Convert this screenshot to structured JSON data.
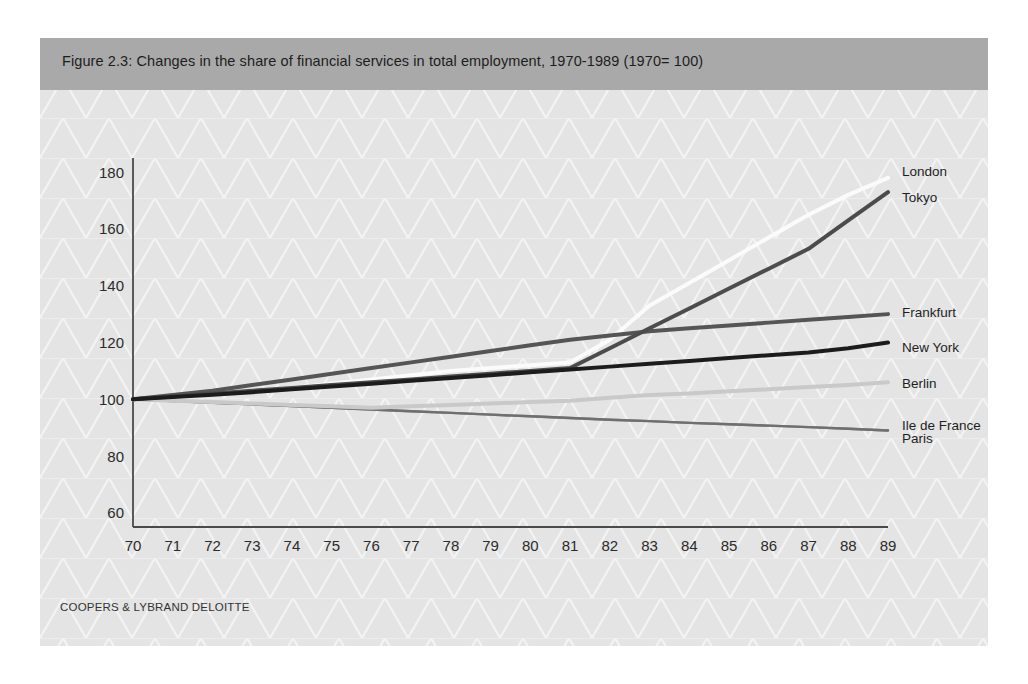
{
  "figure": {
    "caption": "Figure 2.3: Changes in the share of financial services in total employment, 1970-1989  (1970= 100)",
    "source_note": "COOPERS & LYBRAND DELOITTE",
    "background_color": "#e4e4e4",
    "caption_band_color": "#a9a9a9",
    "lattice_color": "#f4f4f4"
  },
  "chart_data": {
    "type": "line",
    "title": "Figure 2.3: Changes in the share of financial services in total employment, 1970-1989  (1970= 100)",
    "xlabel": "",
    "ylabel": "",
    "grid": false,
    "legend_position": "right-inline",
    "xlim": [
      70,
      89
    ],
    "ylim": [
      55,
      185
    ],
    "yticks": [
      60,
      80,
      100,
      120,
      140,
      160,
      180
    ],
    "xticks": [
      70,
      71,
      72,
      73,
      74,
      75,
      76,
      77,
      78,
      79,
      80,
      81,
      82,
      83,
      84,
      85,
      86,
      87,
      88,
      89
    ],
    "categories": [
      "70",
      "71",
      "72",
      "73",
      "74",
      "75",
      "76",
      "77",
      "78",
      "79",
      "80",
      "81",
      "82",
      "83",
      "84",
      "85",
      "86",
      "87",
      "88",
      "89"
    ],
    "x": [
      70,
      71,
      72,
      73,
      74,
      75,
      76,
      77,
      78,
      79,
      80,
      81,
      82,
      83,
      84,
      85,
      86,
      87,
      88,
      89
    ],
    "series": [
      {
        "name": "London",
        "color": "#fbfbfb",
        "width": 4.0,
        "values": [
          100,
          101,
          102,
          103,
          104,
          105.5,
          107,
          108.5,
          110,
          111,
          112,
          113,
          121,
          133,
          141,
          149,
          157,
          165,
          172,
          178
        ]
      },
      {
        "name": "Tokyo",
        "color": "#4c4c4c",
        "width": 4.0,
        "values": [
          100,
          101,
          102,
          103,
          104,
          105,
          106,
          107,
          108,
          109,
          110,
          111,
          118,
          125,
          132,
          139,
          146,
          153,
          163,
          173
        ]
      },
      {
        "name": "Frankfurt",
        "color": "#555555",
        "width": 4.0,
        "values": [
          100,
          101.5,
          103,
          105,
          107,
          109,
          111,
          113,
          115,
          117,
          119,
          121,
          122.5,
          124,
          125,
          126,
          127,
          128,
          129,
          130
        ]
      },
      {
        "name": "New York",
        "color": "#1c1c1c",
        "width": 4.0,
        "values": [
          100,
          100.8,
          101.6,
          102.5,
          103.5,
          104.5,
          105.5,
          106.5,
          107.5,
          108.5,
          109.5,
          110.5,
          111.5,
          112.5,
          113.5,
          114.5,
          115.5,
          116.5,
          118,
          120
        ]
      },
      {
        "name": "Berlin",
        "color": "#c9c9c9",
        "width": 4.0,
        "values": [
          100,
          99.5,
          99,
          98.5,
          98,
          97.5,
          97,
          97.5,
          98,
          98.5,
          99,
          99.5,
          100.5,
          101.5,
          102,
          102.8,
          103.5,
          104.3,
          105,
          106
        ]
      },
      {
        "name": "Ile de France",
        "color": "#8e8e8e",
        "width": 2.4,
        "values": [
          100,
          99.4,
          98.8,
          98.2,
          97.6,
          97,
          96.4,
          95.8,
          95.2,
          94.6,
          94,
          93.4,
          92.8,
          92.3,
          91.7,
          91.2,
          90.7,
          90.2,
          89.6,
          89
        ]
      },
      {
        "name": "Paris",
        "color": "#6f6f6f",
        "width": 2.4,
        "values": [
          100,
          99.4,
          98.8,
          98.2,
          97.6,
          97,
          96.4,
          95.8,
          95.2,
          94.6,
          94,
          93.4,
          92.8,
          92.3,
          91.7,
          91.2,
          90.7,
          90.2,
          89.6,
          89
        ]
      }
    ],
    "series_labels": [
      {
        "name": "London",
        "text": "London",
        "value_at_end": 178
      },
      {
        "name": "Tokyo",
        "text": "Tokyo",
        "value_at_end": 173
      },
      {
        "name": "Frankfurt",
        "text": "Frankfurt",
        "value_at_end": 130
      },
      {
        "name": "New York",
        "text": "New York",
        "value_at_end": 120
      },
      {
        "name": "Berlin",
        "text": "Berlin",
        "value_at_end": 106
      },
      {
        "name": "Ile de France",
        "text": "Ile de France",
        "value_at_end": 89
      },
      {
        "name": "Paris",
        "text": "Paris",
        "value_at_end": 89
      }
    ]
  },
  "y_axis": {
    "ticks": [
      "180",
      "160",
      "140",
      "120",
      "100",
      "80",
      "60"
    ]
  },
  "x_axis": {
    "ticks": [
      "70",
      "71",
      "72",
      "73",
      "74",
      "75",
      "76",
      "77",
      "78",
      "79",
      "80",
      "81",
      "82",
      "83",
      "84",
      "85",
      "86",
      "87",
      "88",
      "89"
    ]
  },
  "legend_text": {
    "london": "London",
    "tokyo": "Tokyo",
    "frankfurt": "Frankfurt",
    "new_york": "New York",
    "berlin": "Berlin",
    "ile_de_france": "Ile de France",
    "paris": "Paris"
  }
}
